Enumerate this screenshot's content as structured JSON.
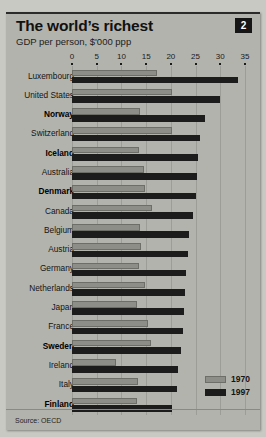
{
  "header": {
    "title": "The world’s richest",
    "subtitle": "GDP per person, $'000 ppp",
    "number_badge": "2"
  },
  "footer": {
    "source": "Source: OECD"
  },
  "legend": {
    "position": "bottom-right",
    "entries": [
      {
        "label": "1970",
        "color": "#8e8e88",
        "icon": "legend-swatch-1970"
      },
      {
        "label": "1997",
        "color": "#1c1c1c",
        "icon": "legend-swatch-1997"
      }
    ]
  },
  "chart_data": {
    "type": "bar",
    "orientation": "horizontal",
    "title": "The world’s richest",
    "subtitle": "GDP per person, $'000 ppp",
    "xlabel": "",
    "ylabel": "",
    "xlim": [
      0,
      35
    ],
    "xticks": [
      0,
      5,
      10,
      15,
      20,
      25,
      30,
      35
    ],
    "xtick_labels": [
      "0",
      "5",
      "10",
      "15",
      "20",
      "25",
      "30",
      "35"
    ],
    "grid": true,
    "axis_position": "top",
    "categories": [
      "Luxembourg",
      "United States",
      "Norway",
      "Switzerland",
      "Iceland",
      "Australia",
      "Denmark",
      "Canada",
      "Belgium",
      "Austria",
      "Germany",
      "Netherlands",
      "Japan",
      "France",
      "Sweden",
      "Ireland",
      "Italy",
      "Finland"
    ],
    "emphasized_categories": [
      "Norway",
      "Iceland",
      "Denmark",
      "Sweden",
      "Finland"
    ],
    "series": [
      {
        "name": "1970",
        "color": "#8e8e88",
        "values": [
          17.2,
          20.2,
          13.8,
          20.2,
          13.6,
          14.6,
          14.8,
          16.2,
          13.8,
          14.0,
          13.6,
          14.8,
          13.2,
          15.4,
          16.0,
          8.9,
          13.4,
          13.2
        ]
      },
      {
        "name": "1997",
        "color": "#1c1c1c",
        "values": [
          33.6,
          30.0,
          26.9,
          25.9,
          25.5,
          25.3,
          25.1,
          24.5,
          23.7,
          23.5,
          23.1,
          22.9,
          22.7,
          22.5,
          22.0,
          21.5,
          21.2,
          20.2
        ]
      }
    ],
    "source": "Source: OECD"
  }
}
